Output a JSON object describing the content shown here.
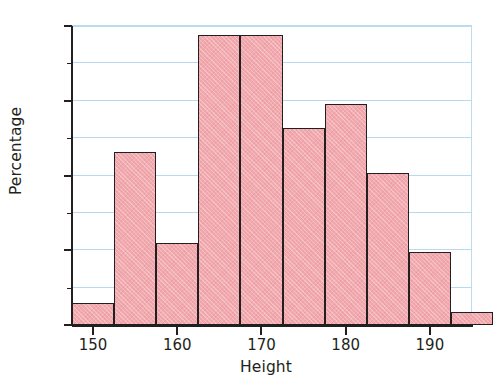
{
  "chart_data": {
    "type": "bar",
    "title": "",
    "subtitle": "",
    "xlabel": "Height",
    "ylabel": "Percentage",
    "xlim": [
      147.5,
      195.0
    ],
    "ylim": [
      0,
      20
    ],
    "bin_width": 5,
    "bin_edges": [
      147.5,
      152.5,
      157.5,
      162.5,
      167.5,
      172.5,
      177.5,
      182.5,
      187.5,
      192.5,
      197.5
    ],
    "categories": [
      "147.5-152.5",
      "152.5-157.5",
      "157.5-162.5",
      "162.5-167.5",
      "167.5-172.5",
      "172.5-177.5",
      "177.5-182.5",
      "182.5-187.5",
      "187.5-192.5",
      "192.5-197.5"
    ],
    "values": [
      1.5,
      11.6,
      5.5,
      19.4,
      19.4,
      13.2,
      14.8,
      10.2,
      4.9,
      0.85
    ],
    "x_ticks": [
      150,
      160,
      170,
      180,
      190
    ],
    "x_tick_labels": [
      "150",
      "160",
      "170",
      "180",
      "190"
    ],
    "y_ticks": [
      0,
      5,
      10,
      15,
      20
    ],
    "y_tick_labels": [
      "0",
      "5",
      "10",
      "15",
      "20"
    ],
    "y_minor_ticks": [
      2.5,
      7.5,
      12.5,
      17.5
    ],
    "gridlines": [
      2.5,
      5,
      7.5,
      10,
      12.5,
      15,
      17.5,
      20
    ],
    "grid": true,
    "legend": null,
    "colors": {
      "bar_fill": "#f2a9ae",
      "bar_edge": "#231f20",
      "gridline": "#b9d9ee",
      "axis": "#231f20",
      "background": "#ffffff",
      "text": "#231f20"
    }
  }
}
